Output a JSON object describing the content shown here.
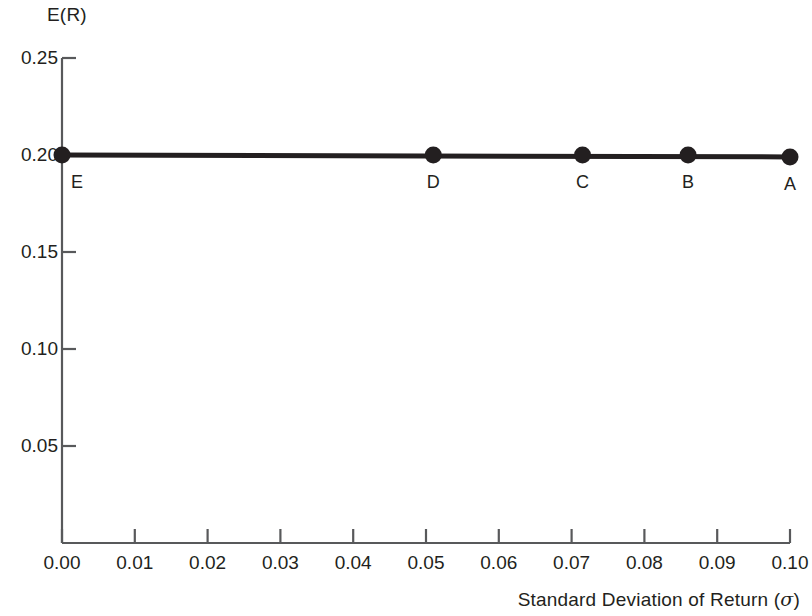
{
  "chart_data": {
    "type": "scatter",
    "title": "",
    "xlabel": "Standard Deviation of Return (σ)",
    "ylabel": "E(R)",
    "xlim": [
      0.0,
      0.1
    ],
    "ylim": [
      0.0,
      0.25
    ],
    "grid": false,
    "legend": "none",
    "x_ticks": [
      "0.00",
      "0.01",
      "0.02",
      "0.03",
      "0.04",
      "0.05",
      "0.06",
      "0.07",
      "0.08",
      "0.09",
      "0.10"
    ],
    "x_tick_values": [
      0.0,
      0.01,
      0.02,
      0.03,
      0.04,
      0.05,
      0.06,
      0.07,
      0.08,
      0.09,
      0.1
    ],
    "y_ticks": [
      "0.05",
      "0.10",
      "0.15",
      "0.20",
      "0.25"
    ],
    "y_tick_values": [
      0.05,
      0.1,
      0.15,
      0.2,
      0.25
    ],
    "series": [
      {
        "name": "Portfolios",
        "point_labels": [
          "E",
          "D",
          "C",
          "B",
          "A"
        ],
        "x": [
          0.0,
          0.051,
          0.0715,
          0.086,
          0.1
        ],
        "y": [
          0.2,
          0.2,
          0.2,
          0.2,
          0.199
        ]
      }
    ],
    "line": {
      "from": [
        0.0,
        0.2
      ],
      "to": [
        0.1,
        0.199
      ]
    }
  },
  "axis_titles": {
    "y": "E(R)",
    "x_text": "Standard Deviation of Return (",
    "x_symbol": "σ",
    "x_close": ")"
  },
  "colors": {
    "ink": "#231f20",
    "axis": "#58595b",
    "background": "#ffffff"
  }
}
